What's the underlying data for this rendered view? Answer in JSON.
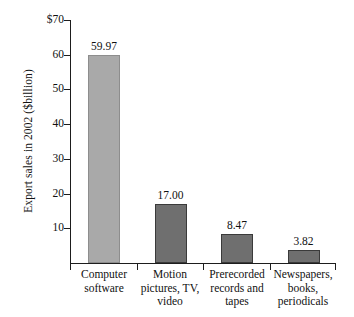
{
  "chart_data": {
    "type": "bar",
    "title": "",
    "xlabel": "",
    "ylabel": "Export sales in 2002 ($billion)",
    "ylim": [
      0,
      70
    ],
    "grid": false,
    "legend": "none",
    "categories": [
      "Computer software",
      "Motion pictures, TV, video",
      "Prerecorded records and tapes",
      "Newspapers, books, periodicals"
    ],
    "values": [
      59.97,
      17.0,
      8.47,
      3.82
    ],
    "value_labels": [
      "59.97",
      "17.00",
      "8.47",
      "3.82"
    ],
    "ytick_labels": [
      "$70",
      "60",
      "50",
      "40",
      "30",
      "20",
      "10"
    ],
    "ytick_values": [
      70,
      60,
      50,
      40,
      30,
      20,
      10
    ],
    "bar_colors": [
      "#a9a9a9",
      "#6f6f6f",
      "#6f6f6f",
      "#6f6f6f"
    ]
  },
  "axis": {
    "y_title": "Export sales in 2002 ($billion)",
    "ticks": [
      {
        "label": "$70",
        "value": 70
      },
      {
        "label": "60",
        "value": 60
      },
      {
        "label": "50",
        "value": 50
      },
      {
        "label": "40",
        "value": 40
      },
      {
        "label": "30",
        "value": 30
      },
      {
        "label": "20",
        "value": 20
      },
      {
        "label": "10",
        "value": 10
      }
    ]
  },
  "bars": [
    {
      "value_label": "59.97",
      "lines": [
        "Computer",
        "software"
      ],
      "line1": "Computer",
      "line2": "software",
      "line3": ""
    },
    {
      "value_label": "17.00",
      "lines": [
        "Motion",
        "pictures, TV,",
        "video"
      ],
      "line1": "Motion",
      "line2": "pictures, TV,",
      "line3": "video"
    },
    {
      "value_label": "8.47",
      "lines": [
        "Prerecorded",
        "records and",
        "tapes"
      ],
      "line1": "Prerecorded",
      "line2": "records and",
      "line3": "tapes"
    },
    {
      "value_label": "3.82",
      "lines": [
        "Newspapers,",
        "books,",
        "periodicals"
      ],
      "line1": "Newspapers,",
      "line2": "books,",
      "line3": "periodicals"
    }
  ]
}
